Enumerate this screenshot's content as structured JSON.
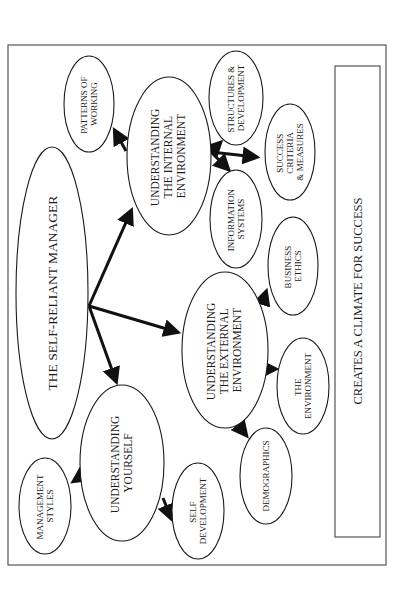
{
  "diagram": {
    "orientation": "rotated-90-ccw",
    "footer": "CREATES A CLIMATE FOR SUCCESS",
    "nodes": {
      "root": {
        "lines": [
          "THE SELF-RELIANT MANAGER"
        ]
      },
      "internal": {
        "lines": [
          "UNDERSTANDING",
          "THE INTERNAL",
          "ENVIRONMENT"
        ]
      },
      "external": {
        "lines": [
          "UNDERSTANDING",
          "THE EXTERNAL",
          "ENVIRONMENT"
        ]
      },
      "yourself": {
        "lines": [
          "UNDERSTANDING",
          "YOURSELF"
        ]
      },
      "patterns": {
        "lines": [
          "PATTERNS OF",
          "WORKING"
        ]
      },
      "structures": {
        "lines": [
          "STRUCTURES &",
          "DEVELOPMENT"
        ]
      },
      "success": {
        "lines": [
          "SUCCESS",
          "CRITERIA",
          "& MEASURES"
        ]
      },
      "infosys": {
        "lines": [
          "INFORMATION",
          "SYSTEMS"
        ]
      },
      "ethics": {
        "lines": [
          "BUSINESS",
          "ETHICS"
        ]
      },
      "environment": {
        "lines": [
          "THE",
          "ENVIRONMENT"
        ]
      },
      "demographics": {
        "lines": [
          "DEMOGRAPHICS"
        ]
      },
      "mgmtstyles": {
        "lines": [
          "MANAGEMENT",
          "STYLES"
        ]
      },
      "selfdev": {
        "lines": [
          "SELF",
          "DEVELOPMENT"
        ]
      }
    },
    "edges": [
      [
        "root",
        "internal"
      ],
      [
        "root",
        "external"
      ],
      [
        "root",
        "yourself"
      ],
      [
        "internal",
        "patterns"
      ],
      [
        "internal",
        "structures"
      ],
      [
        "internal",
        "success"
      ],
      [
        "internal",
        "infosys"
      ],
      [
        "external",
        "ethics"
      ],
      [
        "external",
        "environment"
      ],
      [
        "external",
        "demographics"
      ],
      [
        "yourself",
        "mgmtstyles"
      ],
      [
        "yourself",
        "selfdev"
      ]
    ]
  }
}
